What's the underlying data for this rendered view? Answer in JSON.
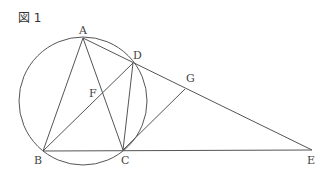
{
  "figure": {
    "title": "図 1",
    "stroke_color": "#555555",
    "circle": {
      "cx": 83,
      "cy": 101,
      "r": 64
    },
    "points": {
      "A": {
        "x": 83,
        "y": 38,
        "label": "A",
        "lx": 79,
        "ly": 34
      },
      "B": {
        "x": 43,
        "y": 151,
        "label": "B",
        "lx": 34,
        "ly": 164
      },
      "C": {
        "x": 123,
        "y": 150,
        "label": "C",
        "lx": 121,
        "ly": 164
      },
      "D": {
        "x": 133,
        "y": 63,
        "label": "D",
        "lx": 133,
        "ly": 59
      },
      "E": {
        "x": 312,
        "y": 150,
        "label": "E",
        "lx": 307,
        "ly": 164
      },
      "F": {
        "x": 103,
        "y": 93,
        "label": "F",
        "lx": 89,
        "ly": 97
      },
      "G": {
        "x": 185,
        "y": 89,
        "label": "G",
        "lx": 186,
        "ly": 82
      }
    },
    "segments": [
      [
        "A",
        "B"
      ],
      [
        "A",
        "C"
      ],
      [
        "A",
        "E"
      ],
      [
        "B",
        "D"
      ],
      [
        "B",
        "E"
      ],
      [
        "C",
        "D"
      ],
      [
        "C",
        "G"
      ]
    ]
  }
}
